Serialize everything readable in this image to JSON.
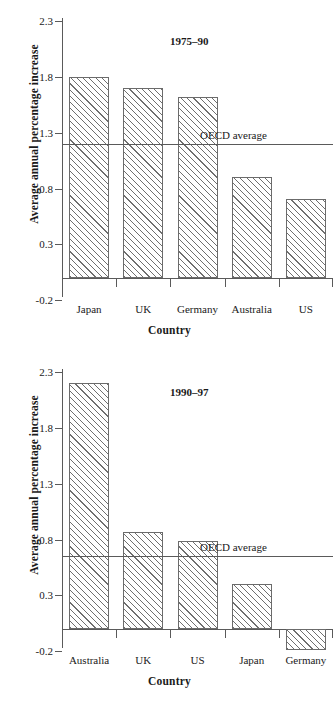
{
  "figure": {
    "ylabel": "Average annual percentage increase",
    "xlabel": "Country",
    "avg_label": "OECD average"
  },
  "chart_data": [
    {
      "type": "bar",
      "title": "1975–90",
      "xlabel": "Country",
      "ylabel": "Average annual percentage increase",
      "categories": [
        "Japan",
        "UK",
        "Germany",
        "Australia",
        "US"
      ],
      "values": [
        1.8,
        1.7,
        1.62,
        0.9,
        0.71
      ],
      "ylim": [
        -0.2,
        2.3
      ],
      "yticks": [
        "2.3",
        "1.8",
        "1.3",
        "0.8",
        "0.3",
        "-0.2"
      ],
      "ytick_values": [
        2.3,
        1.8,
        1.3,
        0.8,
        0.3,
        -0.2
      ],
      "grid": false,
      "legend": "none",
      "annotations": [
        {
          "label": "OECD average",
          "type": "hline",
          "value": 1.2
        }
      ]
    },
    {
      "type": "bar",
      "title": "1990–97",
      "xlabel": "Country",
      "ylabel": "Average annual percentage increase",
      "categories": [
        "Australia",
        "UK",
        "US",
        "Japan",
        "Germany"
      ],
      "values": [
        2.2,
        0.87,
        0.79,
        0.4,
        -0.19
      ],
      "ylim": [
        -0.2,
        2.3
      ],
      "yticks": [
        "2.3",
        "1.8",
        "1.3",
        "0.8",
        "0.3",
        "-0.2"
      ],
      "ytick_values": [
        2.3,
        1.8,
        1.3,
        0.8,
        0.3,
        -0.2
      ],
      "grid": false,
      "legend": "none",
      "annotations": [
        {
          "label": "OECD average",
          "type": "hline",
          "value": 0.65
        }
      ]
    }
  ]
}
